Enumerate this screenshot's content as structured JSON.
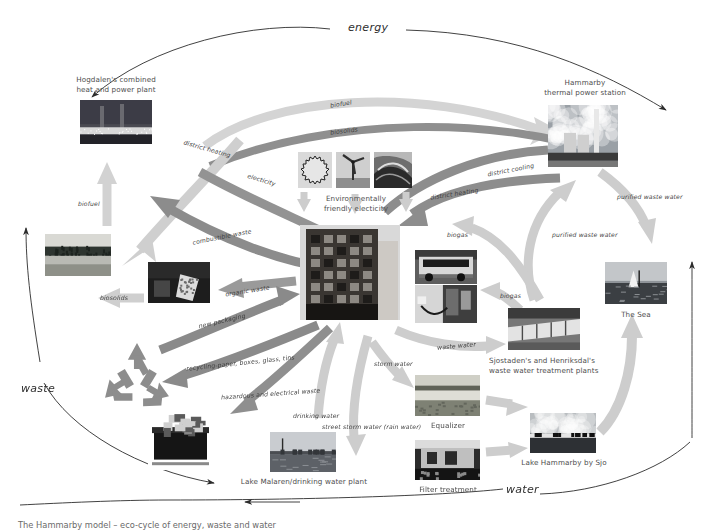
{
  "diagram": {
    "title": "The Hammarby model – eco-cycle of energy, waste and water",
    "cycles": [
      {
        "id": "energy",
        "label": "energy"
      },
      {
        "id": "waste",
        "label": "waste"
      },
      {
        "id": "water",
        "label": "water"
      }
    ],
    "nodes": [
      {
        "id": "hogdalen",
        "label": "Hogdalen's combined\nheat and power plant",
        "x": 80,
        "y": 100,
        "w": 72,
        "h": 44,
        "scene": "powerplant"
      },
      {
        "id": "hammarby",
        "label": "Hammarby\nthermal power station",
        "x": 548,
        "y": 105,
        "w": 70,
        "h": 62,
        "scene": "thermal"
      },
      {
        "id": "greenelec",
        "label": "Environmentally\nfriendly electicity",
        "x": 298,
        "y": 152,
        "w": 114,
        "h": 40,
        "scene": "icons"
      },
      {
        "id": "building",
        "label": "",
        "x": 300,
        "y": 225,
        "w": 100,
        "h": 95,
        "scene": "building"
      },
      {
        "id": "forest",
        "label": "",
        "x": 45,
        "y": 234,
        "w": 66,
        "h": 42,
        "scene": "forest"
      },
      {
        "id": "compost",
        "label": "",
        "x": 148,
        "y": 262,
        "w": 62,
        "h": 41,
        "scene": "compost"
      },
      {
        "id": "recycle",
        "label": "",
        "x": 98,
        "y": 340,
        "w": 76,
        "h": 68,
        "scene": "recycle"
      },
      {
        "id": "bin",
        "label": "",
        "x": 148,
        "y": 405,
        "w": 65,
        "h": 65,
        "scene": "bin"
      },
      {
        "id": "bus",
        "label": "",
        "x": 415,
        "y": 250,
        "w": 62,
        "h": 34,
        "scene": "bus"
      },
      {
        "id": "fuelpump",
        "label": "",
        "x": 415,
        "y": 285,
        "w": 62,
        "h": 38,
        "scene": "pump"
      },
      {
        "id": "treatment",
        "label": "Sjostaden's and Henriksdal's\nwaste water treatment plants",
        "x": 508,
        "y": 308,
        "w": 72,
        "h": 42,
        "scene": "pipes"
      },
      {
        "id": "thesea",
        "label": "The Sea",
        "x": 605,
        "y": 262,
        "w": 62,
        "h": 42,
        "scene": "sea"
      },
      {
        "id": "lakehammarby",
        "label": "Lake Hammarby by Sjo",
        "x": 530,
        "y": 413,
        "w": 66,
        "h": 40,
        "scene": "lake"
      },
      {
        "id": "equalizer",
        "label": "Equalizer",
        "x": 415,
        "y": 375,
        "w": 65,
        "h": 41,
        "scene": "equalizer"
      },
      {
        "id": "filter",
        "label": "Filter treatment",
        "x": 415,
        "y": 440,
        "w": 65,
        "h": 40,
        "scene": "filter"
      },
      {
        "id": "lakemalaren",
        "label": "Lake Malaren/drinking water plant",
        "x": 270,
        "y": 432,
        "w": 66,
        "h": 40,
        "scene": "malaren"
      }
    ],
    "flows": [
      {
        "id": "biofuel-top",
        "label": "biofuel",
        "x": 330,
        "y": 104,
        "rot": -9,
        "tone": "light"
      },
      {
        "id": "biosolids-top",
        "label": "biosolids",
        "x": 330,
        "y": 131,
        "rot": -7,
        "tone": "mid"
      },
      {
        "id": "district-heating-1",
        "label": "district heating",
        "x": 183,
        "y": 148,
        "rot": 16,
        "tone": "light"
      },
      {
        "id": "electricity",
        "label": "electicity",
        "x": 247,
        "y": 179,
        "rot": 17,
        "tone": "mid"
      },
      {
        "id": "biofuel-left",
        "label": "biofuel",
        "x": 82,
        "y": 203,
        "rot": 0,
        "tone": "light"
      },
      {
        "id": "combustible",
        "label": "combustible waste",
        "x": 194,
        "y": 236,
        "rot": -11,
        "tone": "mid"
      },
      {
        "id": "biosolids-left",
        "label": "biosolids",
        "x": 103,
        "y": 296,
        "rot": 0,
        "tone": "light"
      },
      {
        "id": "organic-waste",
        "label": "organic waste",
        "x": 203,
        "y": 290,
        "rot": -9,
        "tone": "mid"
      },
      {
        "id": "new-packaging",
        "label": "new packaging",
        "x": 199,
        "y": 320,
        "rot": -13,
        "tone": "mid"
      },
      {
        "id": "recycling",
        "label": "recycling-paper, boxes, glass, tins",
        "x": 186,
        "y": 362,
        "rot": -6,
        "tone": "mid"
      },
      {
        "id": "hazardous",
        "label": "hazardous and electrical waste",
        "x": 221,
        "y": 393,
        "rot": -4,
        "tone": "mid"
      },
      {
        "id": "district-cooling",
        "label": "district cooling",
        "x": 489,
        "y": 169,
        "rot": -11,
        "tone": "mid"
      },
      {
        "id": "district-heating-2",
        "label": "district heating",
        "x": 432,
        "y": 193,
        "rot": -9,
        "tone": "mid"
      },
      {
        "id": "purified-1",
        "label": "purified waste water",
        "x": 621,
        "y": 196,
        "rot": 0,
        "tone": "light"
      },
      {
        "id": "purified-2",
        "label": "purified waste water",
        "x": 556,
        "y": 234,
        "rot": 0,
        "tone": "light"
      },
      {
        "id": "biogas-1",
        "label": "biogas",
        "x": 448,
        "y": 234,
        "rot": 0,
        "tone": "light"
      },
      {
        "id": "biogas-2",
        "label": "biogas",
        "x": 501,
        "y": 295,
        "rot": 0,
        "tone": "light"
      },
      {
        "id": "waste-water",
        "label": "waste water",
        "x": 440,
        "y": 345,
        "rot": -5,
        "tone": "light"
      },
      {
        "id": "storm-water",
        "label": "storm water",
        "x": 376,
        "y": 363,
        "rot": 0,
        "tone": "light"
      },
      {
        "id": "drinking-water",
        "label": "drinking water",
        "x": 297,
        "y": 415,
        "rot": 0,
        "tone": "light"
      },
      {
        "id": "street-storm",
        "label": "street storm water (rain water)",
        "x": 330,
        "y": 425,
        "rot": 0,
        "tone": "light"
      }
    ],
    "colors": {
      "arrow_light": "#cdcdcd",
      "arrow_mid": "#8f8f8f",
      "outline": "#2c2c2c",
      "text": "#4d4d4d"
    }
  }
}
